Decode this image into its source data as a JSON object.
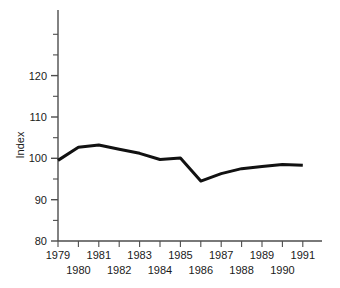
{
  "chart_data": {
    "type": "line",
    "title": "",
    "subtitle": "",
    "xlabel": "",
    "ylabel": "Index",
    "x": [
      1979,
      1980,
      1981,
      1982,
      1983,
      1984,
      1985,
      1986,
      1987,
      1988,
      1989,
      1990,
      1991
    ],
    "values": [
      99.5,
      102.7,
      103.2,
      102.2,
      101.2,
      99.7,
      100.1,
      94.5,
      96.3,
      97.5,
      98.0,
      98.5,
      98.3
    ],
    "series": [
      {
        "name": "Index",
        "values": [
          99.5,
          102.7,
          103.2,
          102.2,
          101.2,
          99.7,
          100.1,
          94.5,
          96.3,
          97.5,
          98.0,
          98.5,
          98.3
        ]
      }
    ],
    "xlim": [
      1979,
      1991
    ],
    "ylim": [
      80,
      135
    ],
    "y_ticks_major": [
      80,
      90,
      100,
      110,
      120
    ],
    "y_ticks_minor": [
      85,
      95,
      105,
      115,
      125,
      130
    ],
    "y_tick_labels": [
      "80",
      "90",
      "100",
      "110",
      "120"
    ],
    "x_tick_labels_top": [
      "1979",
      "1981",
      "1983",
      "1985",
      "1987",
      "1989",
      "1991"
    ],
    "x_tick_labels_bottom": [
      "1980",
      "1982",
      "1984",
      "1986",
      "1988",
      "1990"
    ],
    "grid": false,
    "legend": false,
    "legend_position": "none",
    "line_color": "#111111",
    "axis_color": "#4d4d4d",
    "background_color": "#ffffff"
  },
  "axis": {
    "y_label": "Index",
    "y_tick_0": "80",
    "y_tick_1": "90",
    "y_tick_2": "100",
    "y_tick_3": "110",
    "y_tick_4": "120",
    "x_top_0": "1979",
    "x_top_1": "1981",
    "x_top_2": "1983",
    "x_top_3": "1985",
    "x_top_4": "1987",
    "x_top_5": "1989",
    "x_top_6": "1991",
    "x_bot_0": "1980",
    "x_bot_1": "1982",
    "x_bot_2": "1984",
    "x_bot_3": "1986",
    "x_bot_4": "1988",
    "x_bot_5": "1990"
  }
}
